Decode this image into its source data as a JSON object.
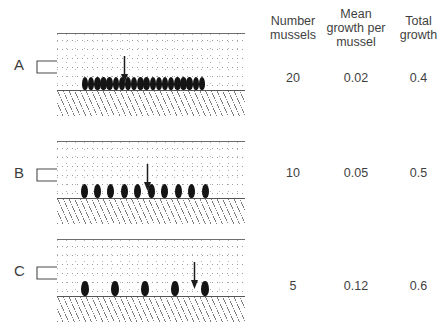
{
  "figure": {
    "panels": [
      {
        "id": "A",
        "label": "A",
        "flow_arrow_name": "water-flow-arrow",
        "mussel_count": 20,
        "spacing": "dense",
        "sampling_arrow_x": 63,
        "description": "Dense bed of 20 mussels packed together on the substrate"
      },
      {
        "id": "B",
        "label": "B",
        "flow_arrow_name": "water-flow-arrow",
        "mussel_count": 10,
        "spacing": "medium",
        "sampling_arrow_x": 86,
        "description": "10 evenly spaced mussels on the substrate"
      },
      {
        "id": "C",
        "label": "C",
        "flow_arrow_name": "water-flow-arrow",
        "mussel_count": 5,
        "spacing": "sparse",
        "sampling_arrow_x": 133,
        "description": "5 widely spaced mussels on the substrate"
      }
    ]
  },
  "table": {
    "headers": {
      "number": "Number\nmussels",
      "number_line1": "Number",
      "number_line2": "mussels",
      "mean_line1": "Mean",
      "mean_line2": "growth per",
      "mean_line3": "mussel",
      "total_line1": "Total",
      "total_line2": "growth"
    },
    "rows": [
      {
        "panel": "A",
        "number_mussels": "20",
        "mean_growth_per_mussel": "0.02",
        "total_growth": "0.4"
      },
      {
        "panel": "B",
        "number_mussels": "10",
        "mean_growth_per_mussel": "0.05",
        "total_growth": "0.5"
      },
      {
        "panel": "C",
        "number_mussels": "5",
        "mean_growth_per_mussel": "0.12",
        "total_growth": "0.6"
      }
    ]
  },
  "colors": {
    "mussel": "#141414",
    "line": "#555555",
    "text": "#3f3f3f",
    "hatch": "#7d7d7d",
    "background": "#ffffff"
  }
}
